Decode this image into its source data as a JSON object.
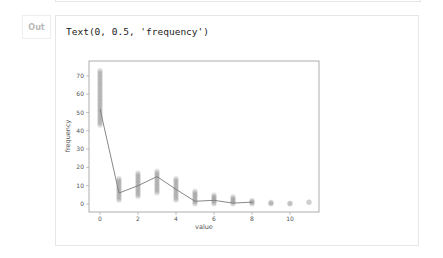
{
  "cell": {
    "prompt_label": "Out",
    "output_text": "Text(0, 0.5, 'frequency')"
  },
  "chart_data": {
    "type": "scatter",
    "title": "",
    "xlabel": "value",
    "ylabel": "frequency",
    "xlim": [
      -0.6,
      11.5
    ],
    "ylim": [
      -3,
      76
    ],
    "x_ticks": [
      0,
      2,
      4,
      6,
      8,
      10
    ],
    "y_ticks": [
      0,
      10,
      20,
      30,
      40,
      50,
      60,
      70
    ],
    "grid": false,
    "scatter_series": {
      "name": "observations",
      "color": "#6e6e6e",
      "alpha": 0.15,
      "ranges": [
        {
          "x": 0,
          "min": 43,
          "max": 73
        },
        {
          "x": 1,
          "min": 2,
          "max": 14
        },
        {
          "x": 2,
          "min": 4,
          "max": 17
        },
        {
          "x": 3,
          "min": 6,
          "max": 18
        },
        {
          "x": 4,
          "min": 2,
          "max": 14
        },
        {
          "x": 5,
          "min": 0,
          "max": 7
        },
        {
          "x": 6,
          "min": 0,
          "max": 5
        },
        {
          "x": 7,
          "min": 0,
          "max": 4
        },
        {
          "x": 8,
          "min": 0,
          "max": 2
        },
        {
          "x": 9,
          "min": 0,
          "max": 1
        },
        {
          "x": 10,
          "min": 0,
          "max": 0.5
        },
        {
          "x": 11,
          "min": 1,
          "max": 1
        }
      ]
    },
    "line_series": {
      "name": "mean",
      "color": "#7a7a7a",
      "x": [
        0,
        1,
        2,
        3,
        4,
        5,
        6,
        7,
        8
      ],
      "values": [
        52,
        6,
        10,
        15,
        8,
        1.5,
        2,
        0.5,
        1
      ]
    }
  }
}
